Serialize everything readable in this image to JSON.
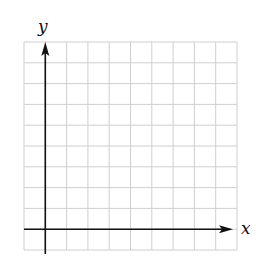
{
  "diagram": {
    "type": "coordinate-grid",
    "grid": {
      "columns": 10,
      "rows": 10,
      "color": "#cfcfcf"
    },
    "axes": {
      "color": "#111111",
      "x_label": "x",
      "y_label": "y",
      "origin_cell": {
        "column": 1,
        "row_from_bottom": 1
      }
    }
  }
}
